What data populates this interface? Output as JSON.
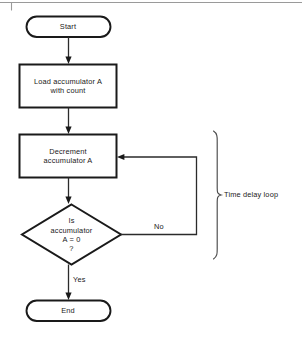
{
  "figure": {
    "colors": {
      "stroke": "#1a1a1a",
      "thin_stroke": "#2b2b2b",
      "rule": "#9a9a9a",
      "background": "#ffffff",
      "text": "#1a1a1a"
    },
    "top_rule": {
      "name": "page-rule",
      "tick_x": 11
    },
    "nodes": [
      {
        "id": "start",
        "shape": "terminal",
        "label": "Start",
        "x": 26,
        "y": 16,
        "w": 84,
        "h": 21
      },
      {
        "id": "load",
        "shape": "process",
        "label": "Load accumulator A\nwith count",
        "x": 19,
        "y": 64,
        "w": 98,
        "h": 44
      },
      {
        "id": "decrement",
        "shape": "process",
        "label": "Decrement\naccumulator A",
        "x": 19,
        "y": 134,
        "w": 98,
        "h": 44
      },
      {
        "id": "decision",
        "shape": "decision",
        "label": "Is\naccumulator\nA = 0\n?",
        "x": 22,
        "y": 204,
        "w": 99,
        "h": 61
      },
      {
        "id": "end",
        "shape": "terminal",
        "label": "End",
        "x": 26,
        "y": 300,
        "w": 84,
        "h": 21
      }
    ],
    "edges": [
      {
        "id": "start-to-load",
        "from": "start",
        "to": "load",
        "label": ""
      },
      {
        "id": "load-to-decrement",
        "from": "load",
        "to": "decrement",
        "label": ""
      },
      {
        "id": "decrement-to-decision",
        "from": "decrement",
        "to": "decision",
        "label": ""
      },
      {
        "id": "decision-no-loop",
        "from": "decision",
        "to": "decrement",
        "label": "No"
      },
      {
        "id": "decision-yes-to-end",
        "from": "decision",
        "to": "end",
        "label": "Yes"
      }
    ],
    "annotation": {
      "id": "time-delay-loop-brace",
      "label": "Time delay loop",
      "brace_x": 218,
      "brace_top": 131,
      "brace_bottom": 259
    }
  }
}
